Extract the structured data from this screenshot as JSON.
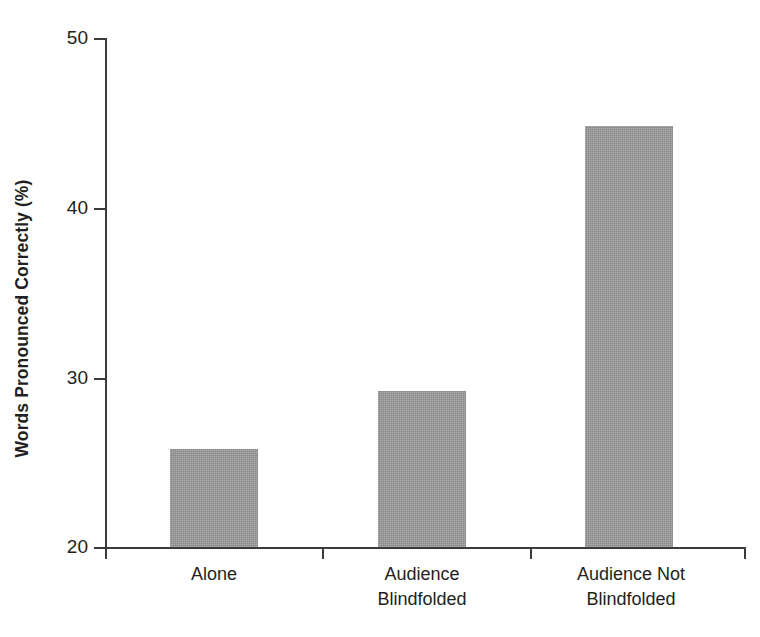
{
  "chart_data": {
    "type": "bar",
    "title": "",
    "subtitle": "",
    "xlabel": "",
    "ylabel": "Words Pronounced Correctly (%)",
    "categories": [
      "Alone",
      "Audience\nBlindfolded",
      "Audience Not\nBlindfolded"
    ],
    "values": [
      25.8,
      29.2,
      44.8
    ],
    "ylim": [
      20,
      50
    ],
    "yticks": [
      20,
      30,
      40,
      50
    ],
    "ytick_labels": [
      "20",
      "30",
      "40",
      "50"
    ],
    "grid": false,
    "legend": null,
    "legend_position": "none",
    "bar_color": "#9a9a9a",
    "axis_color": "#3b3b3b",
    "text_color": "#231f20",
    "background": "#ffffff",
    "annotations": []
  },
  "axis": {
    "y_title": "Words Pronounced Correctly (%)",
    "tick_50": "50",
    "tick_40": "40",
    "tick_30": "30",
    "tick_20": "20"
  },
  "bars": [
    {
      "label": "Alone",
      "value": 25.8
    },
    {
      "label": "Audience\nBlindfolded",
      "value": 29.2
    },
    {
      "label": "Audience Not\nBlindfolded",
      "value": 44.8
    }
  ]
}
